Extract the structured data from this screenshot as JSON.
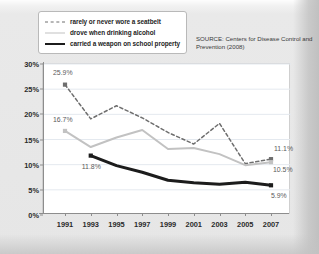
{
  "legend": {
    "items": [
      {
        "label": "rarely or never wore a seatbelt",
        "style": "dashed",
        "color": "#6e6e6e",
        "name": "seatbelt"
      },
      {
        "label": "drove when drinking alcohol",
        "style": "solid",
        "color": "#c2c2c2",
        "name": "alcohol"
      },
      {
        "label": "carried a weapon on school property",
        "style": "solid-bold",
        "color": "#1c1c1c",
        "name": "weapon"
      }
    ]
  },
  "source": {
    "text": "SOURCE: Centers for Disease Control and Prevention (2008)"
  },
  "axes": {
    "y_ticks": [
      "0%",
      "5%",
      "10%",
      "15%",
      "20%",
      "25%",
      "30%"
    ],
    "x_ticks": [
      "1991",
      "1993",
      "1995",
      "1997",
      "1999",
      "2001",
      "2003",
      "2005",
      "2007"
    ]
  },
  "annotations": [
    {
      "id": "a1",
      "text": "25.9%",
      "series": "rarely or never wore a seatbelt",
      "year": 1991,
      "value": 25.9
    },
    {
      "id": "a2",
      "text": "16.7%",
      "series": "drove when drinking alcohol",
      "year": 1991,
      "value": 16.7
    },
    {
      "id": "a3",
      "text": "11.8%",
      "series": "carried a weapon on school property",
      "year": 1993,
      "value": 11.8
    },
    {
      "id": "a4",
      "text": "11.1%",
      "series": "rarely or never wore a seatbelt",
      "year": 2007,
      "value": 11.1
    },
    {
      "id": "a5",
      "text": "10.5%",
      "series": "drove when drinking alcohol",
      "year": 2007,
      "value": 10.5
    },
    {
      "id": "a6",
      "text": "5.9%",
      "series": "carried a weapon on school property",
      "year": 2007,
      "value": 5.9
    }
  ],
  "chart_data": {
    "type": "line",
    "title": "",
    "xlabel": "",
    "ylabel": "",
    "x": [
      1991,
      1993,
      1995,
      1997,
      1999,
      2001,
      2003,
      2005,
      2007
    ],
    "xlim": [
      1990,
      2008
    ],
    "ylim": [
      0,
      30
    ],
    "y_tick_values": [
      0,
      5,
      10,
      15,
      20,
      25,
      30
    ],
    "y_tick_labels": [
      "0%",
      "5%",
      "10%",
      "15%",
      "20%",
      "25%",
      "30%"
    ],
    "grid": "horizontal",
    "legend_position": "top-left",
    "series": [
      {
        "name": "rarely or never wore a seatbelt",
        "style": "dashed",
        "color": "#6e6e6e",
        "marker_years": [
          1991,
          2007
        ],
        "values": [
          25.9,
          19.1,
          21.7,
          19.3,
          16.4,
          14.1,
          18.2,
          10.2,
          11.1
        ]
      },
      {
        "name": "drove when drinking alcohol",
        "style": "solid",
        "color": "#c2c2c2",
        "marker_years": [
          1991,
          2007
        ],
        "values": [
          16.7,
          13.5,
          15.4,
          16.9,
          13.1,
          13.3,
          12.1,
          9.9,
          10.5
        ]
      },
      {
        "name": "carried a weapon on school property",
        "style": "solid-bold",
        "color": "#1c1c1c",
        "marker_years": [
          1993,
          2007
        ],
        "values": [
          null,
          11.8,
          9.8,
          8.5,
          6.9,
          6.4,
          6.1,
          6.5,
          5.9
        ]
      }
    ]
  }
}
